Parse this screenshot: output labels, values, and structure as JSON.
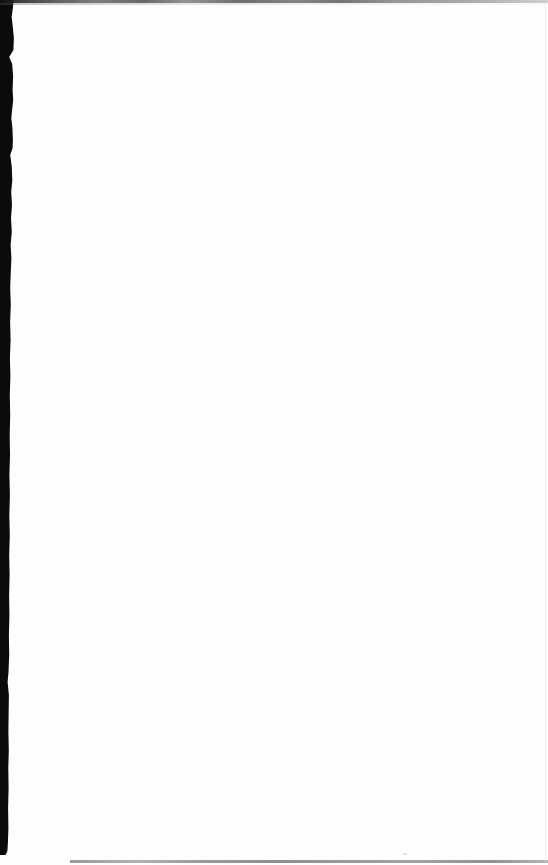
{
  "page": {
    "background_color": "#fdfdfd",
    "left_edge_color": "#0b0b0b",
    "top_edge_color": "#4f4f4f",
    "bottom_edge_color": "#9a9a9a",
    "right_edge_color": "#e2e2e2",
    "speck_color": "#c9c9c9"
  }
}
